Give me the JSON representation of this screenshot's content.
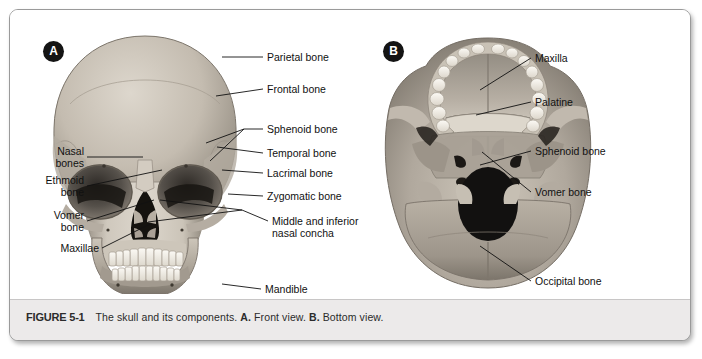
{
  "figure": {
    "number": "FIGURE 5-1",
    "caption_main": "The skull and its components.",
    "caption_a_tag": "A.",
    "caption_a_text": "Front view.",
    "caption_b_tag": "B.",
    "caption_b_text": "Bottom view.",
    "caption_full": "FIGURE 5-1   The skull and its components. A. Front view. B. Bottom view."
  },
  "panels": [
    {
      "letter": "A",
      "view": "Front view",
      "labels_left": [
        {
          "id": "nasal-bones",
          "text": "Nasal\nbones"
        },
        {
          "id": "ethmoid-bone",
          "text": "Ethmoid\nbone"
        },
        {
          "id": "vomer-bone",
          "text": "Vomer\nbone"
        },
        {
          "id": "maxillae",
          "text": "Maxillae"
        }
      ],
      "labels_right": [
        {
          "id": "parietal-bone",
          "text": "Parietal bone"
        },
        {
          "id": "frontal-bone",
          "text": "Frontal bone"
        },
        {
          "id": "sphenoid-bone",
          "text": "Sphenoid bone"
        },
        {
          "id": "temporal-bone",
          "text": "Temporal bone"
        },
        {
          "id": "lacrimal-bone",
          "text": "Lacrimal bone"
        },
        {
          "id": "zygomatic-bone",
          "text": "Zygomatic bone"
        },
        {
          "id": "nasal-concha",
          "text": "Middle and inferior\nnasal concha"
        },
        {
          "id": "mandible",
          "text": "Mandible"
        }
      ]
    },
    {
      "letter": "B",
      "view": "Bottom view",
      "labels_right": [
        {
          "id": "maxilla",
          "text": "Maxilla"
        },
        {
          "id": "palatine",
          "text": "Palatine"
        },
        {
          "id": "sphenoid-bone",
          "text": "Sphenoid bone"
        },
        {
          "id": "vomer-bone",
          "text": "Vomer bone"
        },
        {
          "id": "occipital-bone",
          "text": "Occipital bone"
        }
      ]
    }
  ],
  "colors": {
    "page_background": "#ffffff",
    "card_border": "#9a9a9a",
    "caption_band": "#eceaea",
    "label_text": "#111111",
    "leader_line": "#111111",
    "panel_letter_fill": "#141414",
    "panel_letter_text": "#ffffff",
    "bone_light": "#e3ddd4",
    "bone_mid": "#b9b1a6",
    "bone_dark": "#8e877d",
    "cavity_black": "#141210",
    "teeth": "#f5f2ec"
  }
}
